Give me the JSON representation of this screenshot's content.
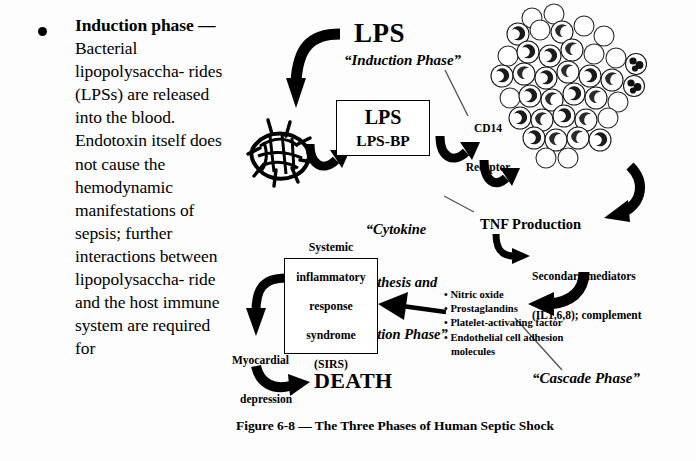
{
  "document": {
    "type": "textbook-page-excerpt",
    "figure_caption": "Figure 6-8 — The Three Phases of Human Septic Shock"
  },
  "text_column": {
    "bullet_marker": "•",
    "heading": "Induction phase",
    "dash": " — ",
    "paragraph": "Bacterial lipopolysaccha-rides (LPSs) are released into the blood. Endotoxin itself does not cause the hemodynamic manifestations of sepsis; further interactions between lipopolysaccha-ride and the host immune system are required for",
    "lines": [
      "Bacterial",
      "lipopolysaccha-",
      "rides (LPSs) are",
      "released into the",
      "blood.",
      "Endotoxin itself",
      "does not cause",
      "the",
      "hemodynamic",
      "manifestations",
      "of sepsis; further",
      "interactions",
      "between",
      "lipopolysaccha-",
      "ride and the host",
      "immune system",
      "are required for"
    ]
  },
  "diagram": {
    "title": "LPS",
    "phases": {
      "induction": "“Induction Phase”",
      "cytokine": [
        "“Cytokine",
        "Synthesis and",
        "Secretion Phase”"
      ],
      "cascade": "“Cascade Phase”"
    },
    "lps_box": {
      "line1": "LPS",
      "line2": "LPS-BP"
    },
    "cd14_receptor": [
      "CD14",
      "Receptor"
    ],
    "tnf_production": "TNF Production",
    "secondary_mediators": [
      "Secondary mediators",
      "(IL1,6,8); complement"
    ],
    "mediator_list": [
      "Nitric oxide",
      "Prostaglandins",
      "Platelet-activating factor",
      "Endothelial cell adhesion",
      "molecules"
    ],
    "mediator_bullet": "•",
    "sirs_box": [
      "Systemic",
      "inflammatory",
      "response",
      "syndrome",
      "(SIRS)"
    ],
    "myocardial_depression": [
      "Myocardial",
      "depression"
    ],
    "death": "DEATH",
    "graphics": {
      "capillary_bed": "capillary-bed-mesh",
      "leukocyte_cluster": "monocyte-macrophage-cluster"
    }
  },
  "colors": {
    "ink": "#000000",
    "paper": "#fdfdfd",
    "leader_line": "#555555"
  }
}
